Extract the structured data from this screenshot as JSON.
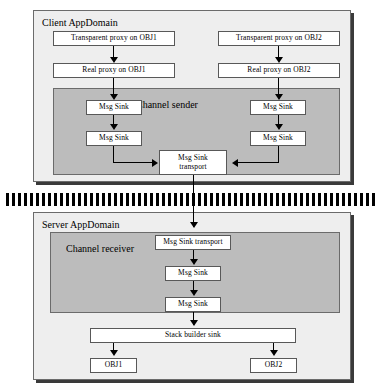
{
  "diagram": {
    "client": {
      "domain_label": "Client AppDomain",
      "channel_label": "Channel sender",
      "proxies": [
        {
          "transparent": "Transparent proxy on OBJ1",
          "real": "Real proxy on OBJ1"
        },
        {
          "transparent": "Transparent proxy on OBJ2",
          "real": "Real proxy on OBJ2"
        }
      ],
      "sinks_left": [
        "Msg Sink",
        "Msg Sink"
      ],
      "sinks_right": [
        "Msg Sink",
        "Msg Sink"
      ],
      "transport": {
        "line1": "Msg Sink",
        "line2": "transport"
      }
    },
    "boundary": {
      "name": "appdomain-boundary",
      "style": "dashed-band"
    },
    "server": {
      "domain_label": "Server AppDomain",
      "channel_label": "Channel receiver",
      "transport": "Msg Sink transport",
      "sinks": [
        "Msg Sink",
        "Msg Sink"
      ],
      "stack_builder": "Stack builder sink",
      "objects": [
        "OBJ1",
        "OBJ2"
      ]
    }
  },
  "colors": {
    "frame_fill": "#eeeeee",
    "panel_fill": "#bcbcbc",
    "node_fill": "#ffffff",
    "stroke": "#585858",
    "boundary": "#000000"
  }
}
